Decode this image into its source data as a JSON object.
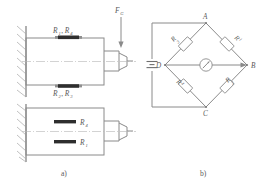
{
  "figure": {
    "title_text": "Strain gauge cantilever beam and Wheatstone bridge circuit",
    "subfigures": [
      {
        "id": "a",
        "caption": "a)"
      },
      {
        "id": "b",
        "caption": "b)"
      }
    ]
  },
  "panel_a": {
    "caption": "a)",
    "force_label": "F",
    "force_subscript": "G",
    "top_beam": {
      "top_gauge_label": "R",
      "top_gauge_sub": "1",
      "top_gauge_label2": "R",
      "top_gauge_sub2": "4",
      "top_gauge_text": "R₁, R₄",
      "bottom_gauge_text": "R₂, R₃"
    },
    "bottom_beam": {
      "upper_gauge_text": "R₄",
      "lower_gauge_text": "R₁"
    },
    "labels": {
      "r1r4": "R",
      "r1r4_s1": "1",
      "r1r4_s2": "4",
      "r2r3": "R",
      "r2r3_s1": "2",
      "r2r3_s2": "3",
      "r4": "R",
      "r4_sub": "4",
      "r1": "R",
      "r1_sub": "1",
      "comma": ","
    }
  },
  "panel_b": {
    "caption": "b)",
    "nodes": {
      "top": "A",
      "right": "B",
      "bottom": "C",
      "left": "D"
    },
    "resistors": [
      {
        "name": "R",
        "sub": "3",
        "position": "upper-left"
      },
      {
        "name": "R",
        "sub": "1",
        "position": "upper-right"
      },
      {
        "name": "R",
        "sub": "4",
        "position": "lower-left"
      },
      {
        "name": "R",
        "sub": "2",
        "position": "lower-right"
      }
    ],
    "meter": "galvanometer",
    "source": "dc-battery"
  },
  "colors": {
    "line": "#8a8a8a",
    "line_dark": "#6f6f6f",
    "text": "#5a5a5a",
    "gauge": "#2e2e2e",
    "background": "#ffffff"
  }
}
